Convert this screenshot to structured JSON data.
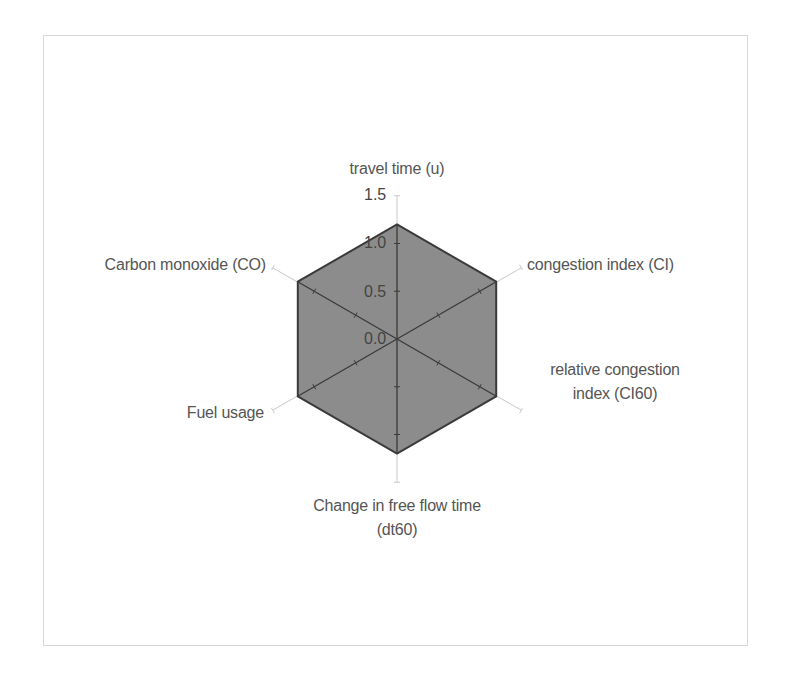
{
  "chart_data": {
    "type": "radar",
    "title": "",
    "categories": [
      "travel time (u)",
      "congestion index (CI)",
      "relative congestion index (CI60)",
      "Change in free flow time (dt60)",
      "Fuel usage",
      "Carbon monoxide (CO)"
    ],
    "series": [
      {
        "name": "Series 1",
        "values": [
          1.2,
          1.2,
          1.2,
          1.2,
          1.2,
          1.2
        ],
        "fill": "#8c8c8c",
        "stroke": "#3a3a3a"
      }
    ],
    "rlim": [
      0,
      1.5
    ],
    "rticks": [
      "0.0",
      "0.5",
      "1.0",
      "1.5"
    ],
    "grid": false,
    "legend": "none"
  },
  "labels": {
    "axis_0": "travel time (u)",
    "axis_1": "congestion index (CI)",
    "axis_2_line1": "relative congestion",
    "axis_2_line2": "index (CI60)",
    "axis_3_line1": "Change in free flow time",
    "axis_3_line2": "(dt60)",
    "axis_4": "Fuel usage",
    "axis_5": "Carbon monoxide (CO)"
  },
  "ticks": {
    "t0": "0.0",
    "t1": "0.5",
    "t2": "1.0",
    "t3": "1.5"
  },
  "colors": {
    "fill": "#8c8c8c",
    "outline": "#3a3a3a",
    "axis": "#c8c8c8",
    "frame": "#d8d8d8"
  }
}
